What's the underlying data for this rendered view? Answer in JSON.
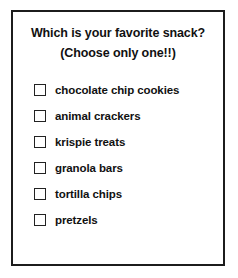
{
  "card": {
    "heading": {
      "line1": "Which is your favorite snack?",
      "line2": "(Choose only one!!)"
    },
    "options": [
      {
        "label": "chocolate chip cookies",
        "icon": "checkbox-unchecked-icon",
        "checked": false
      },
      {
        "label": "animal crackers",
        "icon": "checkbox-unchecked-icon",
        "checked": false
      },
      {
        "label": "krispie treats",
        "icon": "checkbox-unchecked-icon",
        "checked": false
      },
      {
        "label": "granola bars",
        "icon": "checkbox-unchecked-icon",
        "checked": false
      },
      {
        "label": "tortilla chips",
        "icon": "checkbox-unchecked-icon",
        "checked": false
      },
      {
        "label": "pretzels",
        "icon": "checkbox-unchecked-icon",
        "checked": false
      }
    ]
  },
  "colors": {
    "border": "#1c1c1c",
    "text": "#111111",
    "background": "#ffffff",
    "checkbox_border": "#222222"
  }
}
